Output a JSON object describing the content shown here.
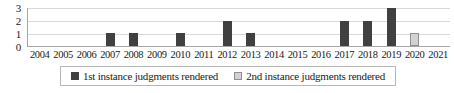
{
  "chart_data": {
    "type": "bar",
    "title": "",
    "xlabel": "",
    "ylabel": "",
    "ylim": [
      0,
      3
    ],
    "yticks": [
      "0",
      "1",
      "2",
      "3"
    ],
    "grid": true,
    "legend_position": "bottom",
    "categories": [
      "2004",
      "2005",
      "2006",
      "2007",
      "2008",
      "2009",
      "2010",
      "2011",
      "2012",
      "2013",
      "2014",
      "2015",
      "2016",
      "2017",
      "2018",
      "2019",
      "2020",
      "2021"
    ],
    "series": [
      {
        "name": "1st instance judgments rendered",
        "color": "#404040",
        "values": [
          0,
          0,
          0,
          1,
          1,
          0,
          1,
          0,
          2,
          1,
          0,
          0,
          0,
          2,
          2,
          3,
          0,
          0
        ]
      },
      {
        "name": "2nd instance judgments rendered",
        "color": "#d2d2d2",
        "values": [
          0,
          0,
          0,
          0,
          0,
          0,
          0,
          0,
          0,
          0,
          0,
          0,
          0,
          0,
          0,
          0,
          1,
          0
        ]
      }
    ]
  },
  "legend": {
    "items": [
      {
        "label": "1st instance judgments rendered"
      },
      {
        "label": "2nd instance judgments rendered"
      }
    ]
  },
  "colors": {
    "series1": "#404040",
    "series2": "#d2d2d2",
    "gridline": "#d9d9d9",
    "axis": "#a6a6a6",
    "background": "#ffffff"
  }
}
